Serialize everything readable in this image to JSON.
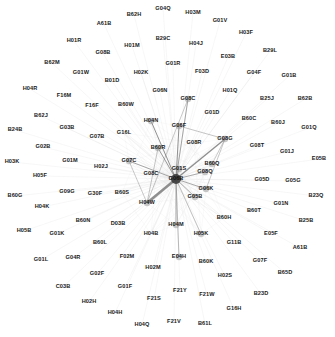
{
  "diagram": {
    "type": "network-graph",
    "hub": {
      "label": "G06B",
      "x": 176,
      "y": 179
    },
    "colors": {
      "edge_strong": "#6e6e6e",
      "edge_light": "#d8d8d8",
      "node": "#555555",
      "label": "#1a1a1a",
      "background": "#ffffff"
    },
    "nodes": [
      {
        "label": "G04Q",
        "x": 163,
        "y": 9
      },
      {
        "label": "B62H",
        "x": 134,
        "y": 15
      },
      {
        "label": "H03M",
        "x": 193,
        "y": 13
      },
      {
        "label": "A61B",
        "x": 104,
        "y": 24
      },
      {
        "label": "G01V",
        "x": 220,
        "y": 21
      },
      {
        "label": "H03F",
        "x": 246,
        "y": 33
      },
      {
        "label": "H01R",
        "x": 74,
        "y": 41
      },
      {
        "label": "B29C",
        "x": 163,
        "y": 39
      },
      {
        "label": "H04J",
        "x": 196,
        "y": 44
      },
      {
        "label": "H01M",
        "x": 132,
        "y": 46
      },
      {
        "label": "B29L",
        "x": 270,
        "y": 51
      },
      {
        "label": "G08B",
        "x": 103,
        "y": 53
      },
      {
        "label": "E03B",
        "x": 228,
        "y": 57
      },
      {
        "label": "B62M",
        "x": 52,
        "y": 63
      },
      {
        "label": "G01R",
        "x": 173,
        "y": 64
      },
      {
        "label": "G01W",
        "x": 81,
        "y": 73
      },
      {
        "label": "H02K",
        "x": 141,
        "y": 73
      },
      {
        "label": "F03D",
        "x": 202,
        "y": 72
      },
      {
        "label": "G04F",
        "x": 254,
        "y": 73
      },
      {
        "label": "G01B",
        "x": 289,
        "y": 76
      },
      {
        "label": "B01D",
        "x": 112,
        "y": 81
      },
      {
        "label": "H04R",
        "x": 30,
        "y": 89
      },
      {
        "label": "F16M",
        "x": 64,
        "y": 96
      },
      {
        "label": "G06N",
        "x": 160,
        "y": 91
      },
      {
        "label": "H01Q",
        "x": 230,
        "y": 91
      },
      {
        "label": "B25J",
        "x": 267,
        "y": 99
      },
      {
        "label": "B62B",
        "x": 305,
        "y": 99
      },
      {
        "label": "F16F",
        "x": 92,
        "y": 106
      },
      {
        "label": "B60W",
        "x": 126,
        "y": 105
      },
      {
        "label": "G08C",
        "x": 188,
        "y": 99
      },
      {
        "label": "G01D",
        "x": 212,
        "y": 113
      },
      {
        "label": "B62J",
        "x": 41,
        "y": 116
      },
      {
        "label": "B60C",
        "x": 249,
        "y": 119
      },
      {
        "label": "B60J",
        "x": 278,
        "y": 123
      },
      {
        "label": "G01Q",
        "x": 309,
        "y": 128
      },
      {
        "label": "B24B",
        "x": 15,
        "y": 130
      },
      {
        "label": "G03B",
        "x": 67,
        "y": 128
      },
      {
        "label": "G16L",
        "x": 124,
        "y": 133
      },
      {
        "label": "G07B",
        "x": 97,
        "y": 137
      },
      {
        "label": "H04N",
        "x": 151,
        "y": 121
      },
      {
        "label": "G06F",
        "x": 179,
        "y": 126
      },
      {
        "label": "G08R",
        "x": 194,
        "y": 143
      },
      {
        "label": "G08G",
        "x": 225,
        "y": 139
      },
      {
        "label": "G08T",
        "x": 257,
        "y": 146
      },
      {
        "label": "G01J",
        "x": 287,
        "y": 152
      },
      {
        "label": "E05B",
        "x": 319,
        "y": 159
      },
      {
        "label": "G02B",
        "x": 43,
        "y": 147
      },
      {
        "label": "B60R",
        "x": 158,
        "y": 148
      },
      {
        "label": "H03K",
        "x": 12,
        "y": 162
      },
      {
        "label": "G01M",
        "x": 70,
        "y": 161
      },
      {
        "label": "H02J",
        "x": 101,
        "y": 167
      },
      {
        "label": "G07C",
        "x": 129,
        "y": 161
      },
      {
        "label": "G01S",
        "x": 179,
        "y": 169
      },
      {
        "label": "B60Q",
        "x": 212,
        "y": 164
      },
      {
        "label": "H05F",
        "x": 40,
        "y": 176
      },
      {
        "label": "G08C",
        "x": 151,
        "y": 174
      },
      {
        "label": "G08Q",
        "x": 205,
        "y": 172
      },
      {
        "label": "G05D",
        "x": 262,
        "y": 180
      },
      {
        "label": "G05G",
        "x": 293,
        "y": 181
      },
      {
        "label": "B23Q",
        "x": 316,
        "y": 196
      },
      {
        "label": "B60G",
        "x": 15,
        "y": 196
      },
      {
        "label": "G09G",
        "x": 67,
        "y": 192
      },
      {
        "label": "G30F",
        "x": 95,
        "y": 194
      },
      {
        "label": "B60S",
        "x": 122,
        "y": 193
      },
      {
        "label": "G06K",
        "x": 206,
        "y": 189
      },
      {
        "label": "H04W",
        "x": 147,
        "y": 203
      },
      {
        "label": "G05B",
        "x": 195,
        "y": 197
      },
      {
        "label": "G01N",
        "x": 281,
        "y": 204
      },
      {
        "label": "H04K",
        "x": 42,
        "y": 207
      },
      {
        "label": "B60N",
        "x": 83,
        "y": 221
      },
      {
        "label": "B60T",
        "x": 254,
        "y": 211
      },
      {
        "label": "B25B",
        "x": 306,
        "y": 221
      },
      {
        "label": "B60H",
        "x": 224,
        "y": 218
      },
      {
        "label": "H05B",
        "x": 24,
        "y": 231
      },
      {
        "label": "G01K",
        "x": 57,
        "y": 234
      },
      {
        "label": "D03B",
        "x": 118,
        "y": 224
      },
      {
        "label": "H04B",
        "x": 151,
        "y": 234
      },
      {
        "label": "H04M",
        "x": 176,
        "y": 225
      },
      {
        "label": "H05K",
        "x": 201,
        "y": 234
      },
      {
        "label": "E05F",
        "x": 271,
        "y": 234
      },
      {
        "label": "B60L",
        "x": 100,
        "y": 243
      },
      {
        "label": "G11B",
        "x": 234,
        "y": 243
      },
      {
        "label": "A61B",
        "x": 300,
        "y": 248
      },
      {
        "label": "G01L",
        "x": 41,
        "y": 260
      },
      {
        "label": "G04R",
        "x": 73,
        "y": 258
      },
      {
        "label": "F02M",
        "x": 127,
        "y": 257
      },
      {
        "label": "H02M",
        "x": 153,
        "y": 268
      },
      {
        "label": "E04H",
        "x": 179,
        "y": 257
      },
      {
        "label": "B60K",
        "x": 206,
        "y": 262
      },
      {
        "label": "G07F",
        "x": 260,
        "y": 261
      },
      {
        "label": "B65D",
        "x": 285,
        "y": 273
      },
      {
        "label": "G02F",
        "x": 97,
        "y": 274
      },
      {
        "label": "H02S",
        "x": 225,
        "y": 276
      },
      {
        "label": "C03B",
        "x": 63,
        "y": 287
      },
      {
        "label": "G01F",
        "x": 125,
        "y": 287
      },
      {
        "label": "B23D",
        "x": 261,
        "y": 294
      },
      {
        "label": "F21Y",
        "x": 180,
        "y": 291
      },
      {
        "label": "F21W",
        "x": 207,
        "y": 295
      },
      {
        "label": "H02H",
        "x": 89,
        "y": 302
      },
      {
        "label": "F21S",
        "x": 154,
        "y": 299
      },
      {
        "label": "G16H",
        "x": 234,
        "y": 309
      },
      {
        "label": "H04H",
        "x": 115,
        "y": 313
      },
      {
        "label": "H04Q",
        "x": 142,
        "y": 325
      },
      {
        "label": "F21V",
        "x": 174,
        "y": 322
      },
      {
        "label": "B61L",
        "x": 205,
        "y": 324
      }
    ],
    "strong_edges": [
      {
        "from": "G06B",
        "to": "H04W",
        "w": 2.6
      },
      {
        "from": "G06B",
        "to": "G08G",
        "w": 1.4
      },
      {
        "from": "G06B",
        "to": "H04N",
        "w": 1.0
      },
      {
        "from": "G06B",
        "to": "G06F",
        "w": 1.0
      },
      {
        "from": "G06B",
        "to": "B60R",
        "w": 0.9
      },
      {
        "from": "G06B",
        "to": "G07C",
        "w": 0.8
      },
      {
        "from": "G06B",
        "to": "G08C",
        "w": 0.8
      },
      {
        "from": "G06B",
        "to": "G01S",
        "w": 0.8
      },
      {
        "from": "G06B",
        "to": "G06K",
        "w": 0.7
      },
      {
        "from": "G06B",
        "to": "H04M",
        "w": 0.7
      },
      {
        "from": "G06B",
        "to": "G08Q",
        "w": 0.7
      },
      {
        "from": "G06B",
        "to": "E04H",
        "w": 0.6
      },
      {
        "from": "G06B",
        "to": "H05K",
        "w": 0.5
      },
      {
        "from": "G06B",
        "to": "G05B",
        "w": 0.7
      },
      {
        "from": "G08G",
        "to": "G06F",
        "w": 0.5
      },
      {
        "from": "G08G",
        "to": "B60Q",
        "w": 0.4
      },
      {
        "from": "G08G",
        "to": "G06K",
        "w": 0.5
      },
      {
        "from": "B60R",
        "to": "H04W",
        "w": 0.5
      },
      {
        "from": "G07C",
        "to": "H04W",
        "w": 0.5
      },
      {
        "from": "G08C",
        "to": "H04W",
        "w": 0.5
      }
    ]
  }
}
